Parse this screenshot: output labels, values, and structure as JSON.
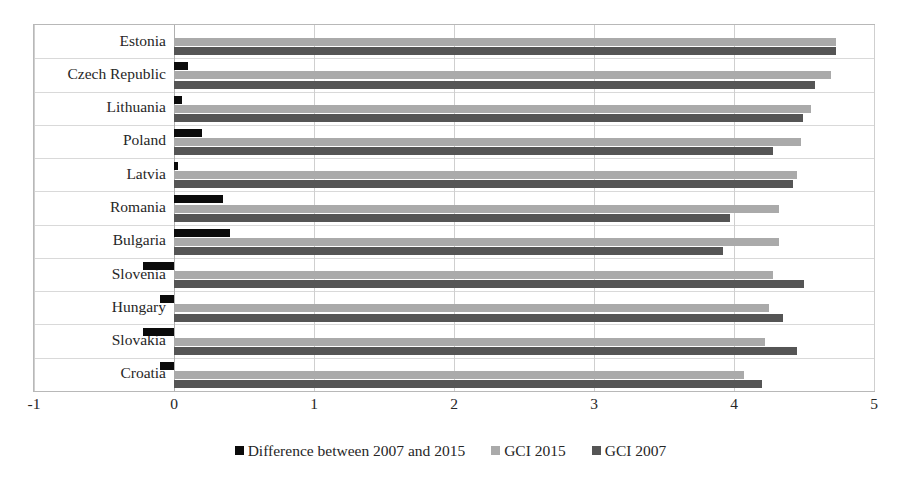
{
  "chart_data": {
    "type": "bar",
    "orientation": "horizontal",
    "title": "",
    "subtitle": "",
    "xlabel": "",
    "ylabel": "",
    "xlim": [
      -1,
      5
    ],
    "xticks": [
      -1,
      0,
      1,
      2,
      3,
      4,
      5
    ],
    "xtick_labels": [
      "-1",
      "0",
      "1",
      "2",
      "3",
      "4",
      "5"
    ],
    "grid": true,
    "grid_axis": "x",
    "legend_position": "bottom",
    "categories": [
      "Estonia",
      "Czech Republic",
      "Lithuania",
      "Poland",
      "Latvia",
      "Romania",
      "Bulgaria",
      "Slovenia",
      "Hungary",
      "Slovakia",
      "Croatia"
    ],
    "series": [
      {
        "name": "Difference between 2007 and 2015",
        "color": "#0b0b0b",
        "values": [
          0.0,
          0.1,
          0.06,
          0.2,
          0.03,
          0.35,
          0.4,
          -0.22,
          -0.1,
          -0.22,
          -0.1
        ]
      },
      {
        "name": "GCI 2015",
        "color": "#aaaaaa",
        "values": [
          4.73,
          4.69,
          4.55,
          4.48,
          4.45,
          4.32,
          4.32,
          4.28,
          4.25,
          4.22,
          4.07
        ]
      },
      {
        "name": "GCI 2007",
        "color": "#555555",
        "values": [
          4.73,
          4.58,
          4.49,
          4.28,
          4.42,
          3.97,
          3.92,
          4.5,
          4.35,
          4.45,
          4.2
        ]
      }
    ]
  },
  "legend": {
    "items": [
      {
        "label": "Difference between 2007 and 2015",
        "color": "#0b0b0b"
      },
      {
        "label": "GCI 2015",
        "color": "#aaaaaa"
      },
      {
        "label": "GCI 2007",
        "color": "#555555"
      }
    ]
  }
}
